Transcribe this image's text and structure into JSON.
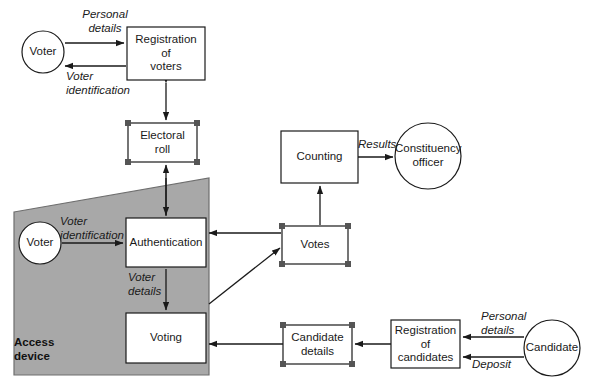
{
  "diagram": {
    "colors": {
      "stroke": "#1a1a1a",
      "region_fill": "#a8a8a8",
      "region_stroke": "#6e6e6e",
      "node_fill": "#ffffff",
      "handle_fill": "#555555",
      "text": "#1a1a1a"
    },
    "regions": [
      {
        "id": "access-device",
        "label": "Access\ndevice",
        "shape": "quadrilateral",
        "points": "14,212 209,178 209,375 14,375"
      }
    ],
    "nodes": [
      {
        "id": "voter-top",
        "label": "Voter",
        "shape": "circle",
        "cx": 43,
        "cy": 52,
        "r": 21,
        "handles": false
      },
      {
        "id": "registration-of-voters",
        "label": "Registration\nof\nvoters",
        "shape": "rect",
        "x": 127,
        "y": 27,
        "w": 78,
        "h": 53,
        "handles": false
      },
      {
        "id": "electoral-roll",
        "label": "Electoral\nroll",
        "shape": "rect",
        "x": 128,
        "y": 123,
        "w": 69,
        "h": 39,
        "handles": true
      },
      {
        "id": "voter-bottom",
        "label": "Voter",
        "shape": "circle",
        "cx": 40,
        "cy": 243,
        "r": 21,
        "handles": false
      },
      {
        "id": "authentication",
        "label": "Authentication",
        "shape": "rect",
        "x": 126,
        "y": 218,
        "w": 80,
        "h": 49,
        "handles": false
      },
      {
        "id": "voting",
        "label": "Voting",
        "shape": "rect",
        "x": 126,
        "y": 313,
        "w": 80,
        "h": 50,
        "handles": false
      },
      {
        "id": "counting",
        "label": "Counting",
        "shape": "rect",
        "x": 281,
        "y": 131,
        "w": 77,
        "h": 52,
        "handles": false
      },
      {
        "id": "votes",
        "label": "Votes",
        "shape": "rect",
        "x": 282,
        "y": 226,
        "w": 66,
        "h": 38,
        "handles": true
      },
      {
        "id": "constituency-officer",
        "label": "Constituency\nofficer",
        "shape": "circle",
        "cx": 428,
        "cy": 156,
        "r": 33,
        "handles": false
      },
      {
        "id": "candidate-details",
        "label": "Candidate\ndetails",
        "shape": "rect",
        "x": 283,
        "y": 325,
        "w": 69,
        "h": 39,
        "handles": true
      },
      {
        "id": "registration-of-candidates",
        "label": "Registration\nof\ncandidates",
        "shape": "rect",
        "x": 391,
        "y": 320,
        "w": 69,
        "h": 48,
        "handles": false
      },
      {
        "id": "candidate",
        "label": "Candidate",
        "shape": "circle",
        "cx": 552,
        "cy": 348,
        "r": 28,
        "handles": false
      }
    ],
    "edges": [
      {
        "id": "voter-to-registration",
        "from": "voter-top",
        "to": "registration-of-voters",
        "label": "Personal\ndetails"
      },
      {
        "id": "registration-to-voter",
        "from": "registration-of-voters",
        "to": "voter-top",
        "label": "Voter\nidentification"
      },
      {
        "id": "registration-roll-bidirectional",
        "from": "registration-of-voters",
        "to": "electoral-roll",
        "label": ""
      },
      {
        "id": "authentication-to-roll",
        "from": "authentication",
        "to": "electoral-roll",
        "label": ""
      },
      {
        "id": "voter-to-authentication",
        "from": "voter-bottom",
        "to": "authentication",
        "label": "Voter\nidentification"
      },
      {
        "id": "authentication-to-voting",
        "from": "authentication",
        "to": "voting",
        "label": "Voter\ndetails"
      },
      {
        "id": "votes-to-authentication",
        "from": "votes",
        "to": "authentication",
        "label": ""
      },
      {
        "id": "voting-to-votes",
        "from": "voting",
        "to": "votes",
        "label": ""
      },
      {
        "id": "votes-to-counting",
        "from": "votes",
        "to": "counting",
        "label": ""
      },
      {
        "id": "counting-to-constituency-officer",
        "from": "counting",
        "to": "constituency-officer",
        "label": "Results"
      },
      {
        "id": "candidate-details-to-voting",
        "from": "candidate-details",
        "to": "voting",
        "label": ""
      },
      {
        "id": "registration-candidates-to-details",
        "from": "registration-of-candidates",
        "to": "candidate-details",
        "label": ""
      },
      {
        "id": "candidate-personal-details",
        "from": "candidate",
        "to": "registration-of-candidates",
        "label": "Personal\ndetails"
      },
      {
        "id": "candidate-deposit",
        "from": "candidate",
        "to": "registration-of-candidates",
        "label": "Deposit"
      }
    ]
  }
}
